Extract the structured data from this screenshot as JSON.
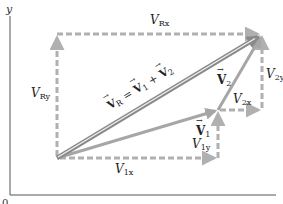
{
  "diagram": {
    "type": "vector-addition",
    "axes": {
      "y_label": "y",
      "x_label": "x",
      "origin_label": "0"
    },
    "colors": {
      "resultant": "#8a8a8a",
      "resultant_core": "#f0f0f0",
      "component_vectors": "#a6a6a6",
      "dashed_components": "#b0b0b0",
      "axis": "#555555"
    },
    "vectors": [
      {
        "name": "V_R",
        "label": "V_R = V_1 + V_2",
        "from": [
          57,
          158
        ],
        "to": [
          262,
          34
        ]
      },
      {
        "name": "V_1",
        "label": "V_1",
        "from": [
          57,
          158
        ],
        "to": [
          218,
          110
        ]
      },
      {
        "name": "V_2",
        "label": "V_2",
        "from": [
          218,
          110
        ],
        "to": [
          262,
          34
        ]
      }
    ],
    "components": [
      {
        "name": "V_Rx",
        "label_main": "V",
        "label_sub": "Rx"
      },
      {
        "name": "V_Ry",
        "label_main": "V",
        "label_sub": "Ry"
      },
      {
        "name": "V_1x",
        "label_main": "V",
        "label_sub": "1x"
      },
      {
        "name": "V_1y",
        "label_main": "V",
        "label_sub": "1y"
      },
      {
        "name": "V_2x",
        "label_main": "V",
        "label_sub": "2x"
      },
      {
        "name": "V_2y",
        "label_main": "V",
        "label_sub": "2y"
      }
    ],
    "resultant_label": {
      "lhs": "V",
      "lhs_sub": "R",
      "eq": " = ",
      "t1": "V",
      "t1_sub": "1",
      "plus": " + ",
      "t2": "V",
      "t2_sub": "2"
    },
    "v1_label": {
      "main": "V",
      "sub": "1"
    },
    "v2_label": {
      "main": "V",
      "sub": "2"
    }
  }
}
